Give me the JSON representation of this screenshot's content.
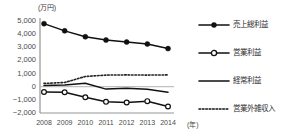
{
  "chart_data": {
    "type": "line",
    "title": "",
    "subtitle": "",
    "unit_label": "(万円)",
    "xlabel": "(年)",
    "ylabel": "",
    "categories": [
      "2008",
      "2009",
      "2010",
      "2011",
      "2012",
      "2013",
      "2014"
    ],
    "x": [
      2008,
      2009,
      2010,
      2011,
      2012,
      2013,
      2014
    ],
    "ylim": [
      -2000,
      5000
    ],
    "ytick_values": [
      -2000,
      -1000,
      0,
      1000,
      2000,
      3000,
      4000,
      5000
    ],
    "ytick_labels": [
      "-2,000",
      "-1,000",
      "0",
      "1,000",
      "2,000",
      "3,000",
      "4,000",
      "5,000"
    ],
    "grid": false,
    "legend_position": "right",
    "series": [
      {
        "name": "売上総利益",
        "values": [
          4800,
          4250,
          3800,
          3550,
          3400,
          3250,
          2900
        ],
        "style": "solid",
        "marker": "filled-circle",
        "color": "#111111"
      },
      {
        "name": "営業利益",
        "values": [
          -400,
          -420,
          -800,
          -1150,
          -1200,
          -1100,
          -1500
        ],
        "style": "solid",
        "marker": "open-circle",
        "color": "#111111"
      },
      {
        "name": "経常利益",
        "values": [
          100,
          120,
          260,
          -180,
          -120,
          -200,
          -420
        ],
        "style": "solid",
        "marker": "none",
        "color": "#111111"
      },
      {
        "name": "営業外雑収入",
        "values": [
          250,
          320,
          780,
          880,
          900,
          880,
          900
        ],
        "style": "dotted",
        "marker": "none",
        "color": "#222222"
      }
    ]
  },
  "legend": {
    "items": [
      {
        "label": "売上総利益",
        "style": "solid",
        "marker": "filled-circle"
      },
      {
        "label": "営業利益",
        "style": "solid",
        "marker": "open-circle"
      },
      {
        "label": "経常利益",
        "style": "solid",
        "marker": "none"
      },
      {
        "label": "営業外雑収入",
        "style": "dotted",
        "marker": "none"
      }
    ]
  },
  "colors": {
    "line": "#111111",
    "axis": "#8a8a8a",
    "zero_line": "#b0b0b0",
    "text": "#4a4a4a"
  }
}
